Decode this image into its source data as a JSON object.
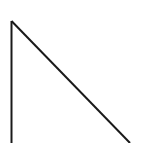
{
  "diagram": {
    "shape": "right-triangle-outline",
    "stroke_color": "#1a1a1a",
    "background_color": "#ffffff",
    "stroke_width": 2,
    "vertices": {
      "apex": [
        11.5,
        21
      ],
      "bottom_left": [
        11.5,
        143
      ],
      "bottom_right": [
        130,
        143
      ]
    }
  }
}
